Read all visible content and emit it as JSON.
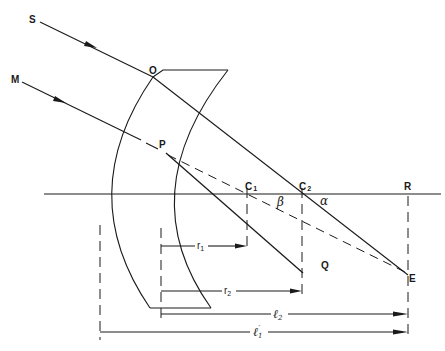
{
  "diagram": {
    "colors": {
      "ink": "#1a1a1a",
      "background": "#ffffff"
    },
    "points": {
      "S": {
        "label": "S"
      },
      "M": {
        "label": "M"
      },
      "O": {
        "label": "O"
      },
      "P": {
        "label": "P"
      },
      "C1": {
        "label": "C",
        "sub": "1"
      },
      "C2": {
        "label": "C",
        "sub": "2"
      },
      "R": {
        "label": "R"
      },
      "Q": {
        "label": "Q"
      },
      "E": {
        "label": "E"
      }
    },
    "angles": {
      "beta": "β",
      "alpha": "α"
    },
    "dimensions": {
      "r1": {
        "label": "r",
        "sub": "1"
      },
      "r2": {
        "label": "r",
        "sub": "2"
      },
      "l2": {
        "label": "ℓ",
        "sub": "2"
      },
      "l1p": {
        "label": "ℓ",
        "sub": "1",
        "prime": "′"
      }
    }
  }
}
